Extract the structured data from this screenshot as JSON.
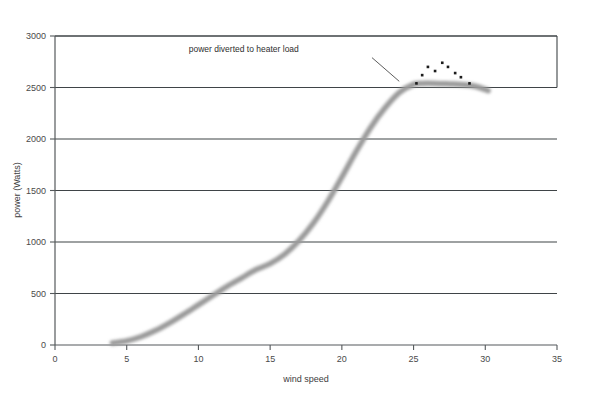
{
  "chart_data": {
    "type": "line",
    "title": "",
    "xlabel": "wind speed",
    "ylabel": "power (Watts)",
    "xlim": [
      0,
      35
    ],
    "ylim": [
      0,
      3000
    ],
    "xticks": [
      0,
      5,
      10,
      15,
      20,
      25,
      30,
      35
    ],
    "yticks": [
      0,
      500,
      1000,
      1500,
      2000,
      2500,
      3000
    ],
    "xtick_labels": [
      "0",
      "5",
      "10",
      "15",
      "20",
      "25",
      "30",
      "35"
    ],
    "ytick_labels": [
      "0",
      "500",
      "1000",
      "1500",
      "2000",
      "2500",
      "3000"
    ],
    "grid": "horizontal",
    "legend": "none",
    "series": [
      {
        "name": "power curve",
        "style": "thick-grey-blurred-line",
        "color": "#9a9a9a",
        "x": [
          4.0,
          5.0,
          6.0,
          7.0,
          8.0,
          9.0,
          10.0,
          11.0,
          12.0,
          13.0,
          14.0,
          15.0,
          16.0,
          17.0,
          18.0,
          19.0,
          20.0,
          21.0,
          22.0,
          23.0,
          24.0,
          25.0,
          25.6,
          26.5,
          27.5,
          28.3,
          29.0,
          29.6,
          30.2
        ],
        "y": [
          20,
          40,
          80,
          140,
          215,
          300,
          390,
          480,
          570,
          650,
          730,
          790,
          880,
          1010,
          1180,
          1390,
          1630,
          1880,
          2110,
          2300,
          2450,
          2530,
          2540,
          2540,
          2535,
          2530,
          2520,
          2500,
          2470
        ]
      },
      {
        "name": "power diverted to heater load",
        "style": "scatter-dots",
        "color": "#1a1a1a",
        "x": [
          25.2,
          25.6,
          26.0,
          26.5,
          27.0,
          27.4,
          27.9,
          28.3,
          28.9
        ],
        "y": [
          2540,
          2620,
          2700,
          2660,
          2740,
          2700,
          2640,
          2600,
          2540
        ]
      }
    ],
    "annotations": [
      {
        "text": "power diverted to heater load",
        "x": 17.0,
        "y": 2840,
        "leader_from": [
          22.1,
          2790
        ],
        "leader_to": [
          24.0,
          2560
        ]
      }
    ]
  },
  "colors": {
    "axis": "#55595c",
    "gridline": "#3f4447",
    "curve": "#9a9a9a",
    "dots": "#1a1a1a",
    "text": "#3d3d3d",
    "background": "#ffffff"
  }
}
